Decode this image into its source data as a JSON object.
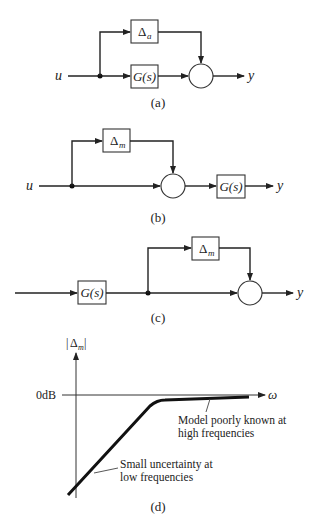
{
  "diagrams": {
    "a": {
      "caption": "(a)",
      "input_label": "u",
      "output_label": "y",
      "uncertainty_block": {
        "symbol": "Δ",
        "subscript": "a"
      },
      "plant_block": "G(s)",
      "type": "additive uncertainty"
    },
    "b": {
      "caption": "(b)",
      "input_label": "u",
      "output_label": "y",
      "uncertainty_block": {
        "symbol": "Δ",
        "subscript": "m"
      },
      "plant_block": "G(s)",
      "type": "input multiplicative uncertainty"
    },
    "c": {
      "caption": "(c)",
      "output_label": "y",
      "uncertainty_block": {
        "symbol": "Δ",
        "subscript": "m"
      },
      "plant_block": "G(s)",
      "type": "output multiplicative uncertainty"
    },
    "d": {
      "caption": "(d)",
      "y_axis_label": {
        "bar_open": "|",
        "symbol": "Δ",
        "subscript": "m",
        "bar_close": "|"
      },
      "x_axis_label": "ω",
      "reference_label": "0dB",
      "annotation_high": [
        "Model poorly known at",
        "high frequencies"
      ],
      "annotation_low": [
        "Small uncertainty at",
        "low frequencies"
      ]
    }
  }
}
